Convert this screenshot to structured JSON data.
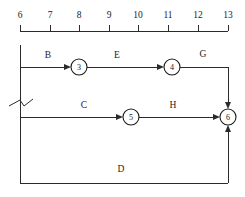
{
  "diagram": {
    "type": "network-schedule",
    "colors": {
      "line": "#2b2b2b",
      "text": "#1a1a1a",
      "background": "#ffffff"
    },
    "axis": {
      "name": "time-scale",
      "orientation": "horizontal",
      "position": "top",
      "ticks": [
        {
          "label": "6",
          "x": 20
        },
        {
          "label": "7",
          "x": 50
        },
        {
          "label": "8",
          "x": 79
        },
        {
          "label": "9",
          "x": 109
        },
        {
          "label": "10",
          "x": 138
        },
        {
          "label": "11",
          "x": 168
        },
        {
          "label": "12",
          "x": 198
        },
        {
          "label": "13",
          "x": 228
        }
      ],
      "line_y": 31,
      "tick_length": 6,
      "label_y": 14
    },
    "nodes": [
      {
        "id": "3",
        "label": "3",
        "cx": 79,
        "cy": 67,
        "r": 8
      },
      {
        "id": "4",
        "label": "4",
        "cx": 172,
        "cy": 67,
        "r": 8
      },
      {
        "id": "5",
        "label": "5",
        "cx": 131,
        "cy": 117,
        "r": 8
      },
      {
        "id": "6",
        "label": "6",
        "cx": 228,
        "cy": 117,
        "r": 8
      }
    ],
    "activities": [
      {
        "id": "B",
        "label": "B",
        "label_x": 48,
        "label_y": 58,
        "from": "start",
        "to": "3"
      },
      {
        "id": "E",
        "label": "E",
        "label_x": 117,
        "label_y": 58,
        "from": "3",
        "to": "4"
      },
      {
        "id": "G",
        "label": "G",
        "label_x": 203,
        "label_y": 57,
        "from": "4",
        "to": "6"
      },
      {
        "id": "C",
        "label": "C",
        "label_x": 84,
        "label_y": 108,
        "from": "start",
        "to": "5"
      },
      {
        "id": "H",
        "label": "H",
        "label_x": 173,
        "label_y": 108,
        "from": "5",
        "to": "6"
      },
      {
        "id": "D",
        "label": "D",
        "label_x": 121,
        "label_y": 172,
        "from": "start",
        "to": "6"
      }
    ],
    "break_symbol": {
      "name": "line-break-symbol",
      "x": 20,
      "y": 103
    },
    "rails": {
      "left_vertical_x": 20,
      "left_vertical_top": 45,
      "left_vertical_bottom": 183,
      "row_top_y": 67,
      "row_middle_y": 117,
      "row_bottom_y": 183,
      "right_vertical_x": 228
    }
  }
}
